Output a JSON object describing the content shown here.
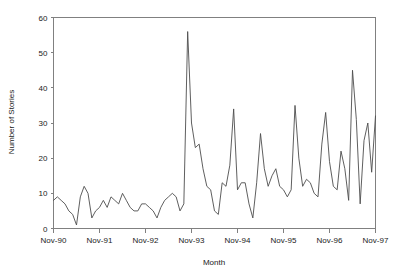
{
  "chart_data": {
    "type": "line",
    "title": "",
    "xlabel": "Month",
    "ylabel": "Number of Stories",
    "grid": false,
    "legend": "none",
    "ylim": [
      0,
      60
    ],
    "yticks": [
      0,
      10,
      20,
      30,
      40,
      50,
      60
    ],
    "ytick_labels": [
      "0",
      "10",
      "20",
      "30",
      "40",
      "50",
      "60"
    ],
    "xtick_labels": [
      "Nov-90",
      "Nov-91",
      "Nov-92",
      "Nov-93",
      "Nov-94",
      "Nov-95",
      "Nov-96",
      "Nov-97"
    ],
    "xtick_index": [
      0,
      12,
      24,
      36,
      48,
      60,
      72,
      84
    ],
    "x_start": "Nov-90",
    "x_end": "Nov-97",
    "x_interval": "monthly",
    "n_points": 85,
    "series": [
      {
        "name": "Number of Stories",
        "color": "#4d4d4d",
        "x": [
          "Nov-90",
          "Dec-90",
          "Jan-91",
          "Feb-91",
          "Mar-91",
          "Apr-91",
          "May-91",
          "Jun-91",
          "Jul-91",
          "Aug-91",
          "Sep-91",
          "Oct-91",
          "Nov-91",
          "Dec-91",
          "Jan-92",
          "Feb-92",
          "Mar-92",
          "Apr-92",
          "May-92",
          "Jun-92",
          "Jul-92",
          "Aug-92",
          "Sep-92",
          "Oct-92",
          "Nov-92",
          "Dec-92",
          "Jan-93",
          "Feb-93",
          "Mar-93",
          "Apr-93",
          "May-93",
          "Jun-93",
          "Jul-93",
          "Aug-93",
          "Sep-93",
          "Oct-93",
          "Nov-93",
          "Dec-93",
          "Jan-94",
          "Feb-94",
          "Mar-94",
          "Apr-94",
          "May-94",
          "Jun-94",
          "Jul-94",
          "Aug-94",
          "Sep-94",
          "Oct-94",
          "Nov-94",
          "Dec-94",
          "Jan-95",
          "Feb-95",
          "Mar-95",
          "Apr-95",
          "May-95",
          "Jun-95",
          "Jul-95",
          "Aug-95",
          "Sep-95",
          "Oct-95",
          "Nov-95",
          "Dec-95",
          "Jan-96",
          "Feb-96",
          "Mar-96",
          "Apr-96",
          "May-96",
          "Jun-96",
          "Jul-96",
          "Aug-96",
          "Sep-96",
          "Oct-96",
          "Nov-96",
          "Dec-96",
          "Jan-97",
          "Feb-97",
          "Mar-97",
          "Apr-97",
          "May-97",
          "Jun-97",
          "Jul-97",
          "Aug-97",
          "Sep-97",
          "Oct-97",
          "Nov-97"
        ],
        "values": [
          8,
          9,
          8,
          7,
          5,
          4,
          1,
          9,
          12,
          10,
          3,
          5,
          6,
          8,
          6,
          9,
          8,
          7,
          10,
          8,
          6,
          5,
          5,
          7,
          7,
          6,
          5,
          3,
          6,
          8,
          9,
          10,
          9,
          5,
          7,
          56,
          30,
          23,
          24,
          17,
          12,
          11,
          5,
          4,
          13,
          12,
          18,
          34,
          11,
          13,
          13,
          7,
          3,
          13,
          27,
          17,
          12,
          15,
          17,
          12,
          11,
          9,
          11,
          35,
          20,
          12,
          14,
          13,
          10,
          9,
          24,
          33,
          19,
          12,
          11,
          22,
          17,
          8,
          45,
          31,
          7,
          25,
          30,
          16,
          32
        ]
      }
    ]
  }
}
